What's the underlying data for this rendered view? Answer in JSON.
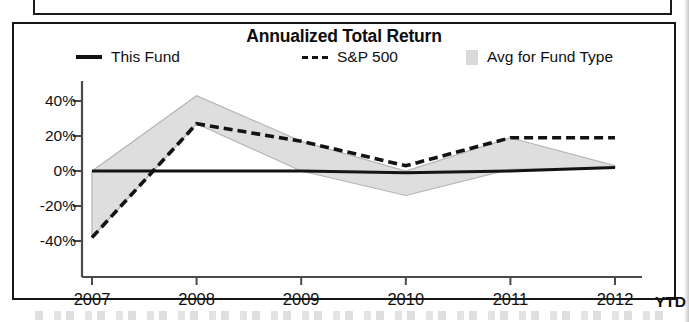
{
  "panel": {
    "title": "Annualized Total Return"
  },
  "legend": [
    {
      "key": "this_fund",
      "label": "This Fund",
      "marker": "solid-line-swatch"
    },
    {
      "key": "sp500",
      "label": "S&P 500",
      "marker": "dashed-line-swatch"
    },
    {
      "key": "avg_fund_type",
      "label": "Avg for Fund Type",
      "marker": "gray-band-swatch"
    }
  ],
  "axis": {
    "x_suffix": "YTD",
    "y_ticks": [
      "40%",
      "20%",
      "0%",
      "-20%",
      "-40%"
    ],
    "x_ticks": [
      "2007",
      "2008",
      "2009",
      "2010",
      "2011",
      "2012"
    ]
  },
  "colors": {
    "line": "#131313",
    "band_fill": "#dedede",
    "band_stroke": "#b4b4b4",
    "axis": "#4a4a4a",
    "border": "#171717",
    "text": "#111111"
  },
  "chart_data": {
    "type": "line",
    "title": "Annualized Total Return",
    "xlabel": "",
    "ylabel": "",
    "x": [
      "2007",
      "2008",
      "2009",
      "2010",
      "2011",
      "2012"
    ],
    "x_note": "2012 value is YTD",
    "ylim": [
      -48,
      48
    ],
    "yticks": [
      40,
      20,
      0,
      -20,
      -40
    ],
    "ytick_labels": [
      "40%",
      "20%",
      "0%",
      "-20%",
      "-40%"
    ],
    "grid": false,
    "legend_position": "top",
    "series": [
      {
        "name": "This Fund",
        "style": "solid",
        "values": [
          0,
          0,
          0,
          -1,
          0,
          2
        ]
      },
      {
        "name": "S&P 500",
        "style": "dashed",
        "values": [
          -38,
          27,
          17,
          3,
          19,
          19
        ]
      },
      {
        "name": "Avg for Fund Type",
        "style": "band",
        "band_upper": [
          0,
          43,
          17,
          0,
          19,
          3
        ],
        "band_lower": [
          -38,
          27,
          0,
          -14,
          1,
          2
        ]
      }
    ]
  }
}
